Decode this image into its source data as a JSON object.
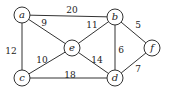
{
  "graph": {
    "type": "weighted-undirected-graph",
    "nodes": [
      {
        "id": "a",
        "label": "a",
        "x": 22,
        "y": 15
      },
      {
        "id": "b",
        "label": "b",
        "x": 115,
        "y": 17
      },
      {
        "id": "e",
        "label": "e",
        "x": 72,
        "y": 48
      },
      {
        "id": "f",
        "label": "f",
        "x": 152,
        "y": 48
      },
      {
        "id": "c",
        "label": "c",
        "x": 22,
        "y": 78
      },
      {
        "id": "d",
        "label": "d",
        "x": 115,
        "y": 78
      }
    ],
    "edges": [
      {
        "from": "a",
        "to": "b",
        "weight": "20",
        "lx": 72,
        "ly": 10
      },
      {
        "from": "a",
        "to": "e",
        "weight": "9",
        "lx": 44,
        "ly": 23
      },
      {
        "from": "e",
        "to": "b",
        "weight": "11",
        "lx": 92,
        "ly": 25
      },
      {
        "from": "b",
        "to": "f",
        "weight": "5",
        "lx": 138,
        "ly": 25
      },
      {
        "from": "a",
        "to": "c",
        "weight": "12",
        "lx": 11,
        "ly": 51
      },
      {
        "from": "b",
        "to": "d",
        "weight": "6",
        "lx": 121,
        "ly": 50
      },
      {
        "from": "c",
        "to": "e",
        "weight": "10",
        "lx": 42,
        "ly": 60
      },
      {
        "from": "e",
        "to": "d",
        "weight": "14",
        "lx": 97,
        "ly": 60
      },
      {
        "from": "d",
        "to": "f",
        "weight": "7",
        "lx": 138,
        "ly": 69
      },
      {
        "from": "c",
        "to": "d",
        "weight": "18",
        "lx": 70,
        "ly": 75
      }
    ]
  },
  "style": {
    "stroke": "#333333",
    "background": "#ffffff",
    "node_radius": 8
  }
}
